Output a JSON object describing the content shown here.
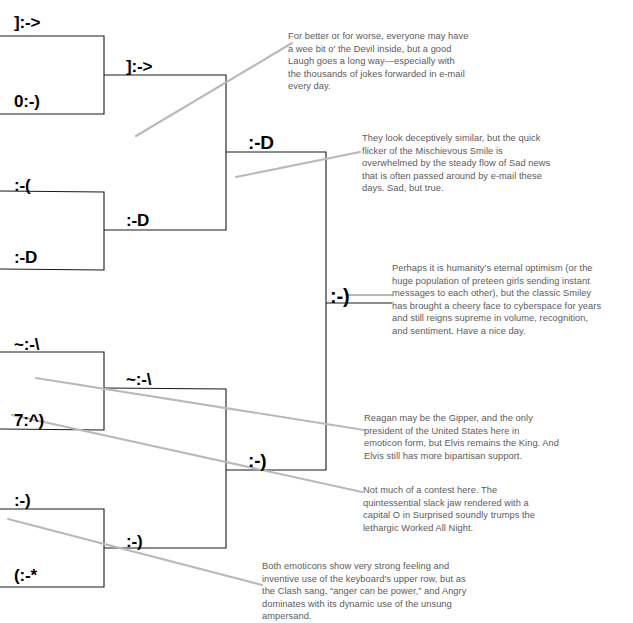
{
  "bracket": {
    "title": "Emoticon Tournament Bracket",
    "round1": [
      {
        "id": "r1-devil",
        "label": "]:->",
        "x": 14,
        "y": 14
      },
      {
        "id": "r1-angel",
        "label": "0:-)",
        "x": 14,
        "y": 93
      },
      {
        "id": "r1-sad",
        "label": ":-(",
        "x": 14,
        "y": 177
      },
      {
        "id": "r1-laugh",
        "label": ":-D",
        "x": 14,
        "y": 249
      },
      {
        "id": "r1-angry",
        "label": "~:-\\",
        "x": 14,
        "y": 336
      },
      {
        "id": "r1-elvis",
        "label": "7:^)",
        "x": 14,
        "y": 412
      },
      {
        "id": "r1-smiley",
        "label": ":-)",
        "x": 14,
        "y": 492
      },
      {
        "id": "r1-surprised",
        "label": "(:-*",
        "x": 14,
        "y": 567
      }
    ],
    "round2": [
      {
        "id": "r2-top",
        "label": "]:->",
        "x": 126,
        "y": 58
      },
      {
        "id": "r2-upmid",
        "label": ":-D",
        "x": 126,
        "y": 212
      },
      {
        "id": "r2-lowmid",
        "label": "~:-\\",
        "x": 126,
        "y": 371
      },
      {
        "id": "r2-bottom",
        "label": ":-)",
        "x": 126,
        "y": 533
      }
    ],
    "round3": [
      {
        "id": "r3-top",
        "label": ":-D",
        "x": 248,
        "y": 133
      },
      {
        "id": "r3-bottom",
        "label": ":-)",
        "x": 248,
        "y": 451
      }
    ],
    "champion": {
      "id": "champion",
      "label": ":-)",
      "x": 330,
      "y": 286
    }
  },
  "notes": [
    {
      "id": "note-devil-vs-laugh",
      "text": "For better or for worse, everyone may have a wee bit o' the Devil inside, but a good Laugh goes a long way—especially with the thousands of jokes forwarded in e-mail every day.",
      "x": 288,
      "y": 30,
      "width": 182
    },
    {
      "id": "note-sad-vs-mischievous",
      "text": "They look deceptively similar, but the quick flicker of the Mischievous Smile is overwhelmed by the steady flow of Sad news that is often passed around by e-mail these days. Sad, but true.",
      "x": 362,
      "y": 132,
      "width": 192
    },
    {
      "id": "note-champion-smiley",
      "text": "Perhaps it is humanity's eternal optimism (or the huge population of preteen girls sending instant messages to each other), but the classic Smiley has brought a cheery face to cyberspace for years and still reigns supreme in volume, recognition, and sentiment. Have a nice day.",
      "x": 392,
      "y": 262,
      "width": 214
    },
    {
      "id": "note-reagan-vs-elvis",
      "text": "Reagan may be the Gipper, and the only president of the United States here in emoticon form, but Elvis remains the King. And Elvis still has more bipartisan support.",
      "x": 364,
      "y": 412,
      "width": 196
    },
    {
      "id": "note-surprised-vs-workedallnight",
      "text": "Not much of a contest here. The quintessential slack jaw rendered with a capital O in Surprised soundly trumps the lethargic Worked All Night.",
      "x": 363,
      "y": 484,
      "width": 192
    },
    {
      "id": "note-angry-vs-clash",
      "text": "Both emoticons show very strong feeling and inventive use of the keyboard's upper row, but as the Clash sang, “anger can be power,” and Angry dominates with its dynamic use of the unsung ampersand.",
      "x": 262,
      "y": 560,
      "width": 218
    }
  ],
  "colors": {
    "rail": "#1a1a1a",
    "leader": "#b9b9b9",
    "note_text": "#5b5b5b",
    "emoticon_text": "#000000",
    "background": "#ffffff"
  }
}
